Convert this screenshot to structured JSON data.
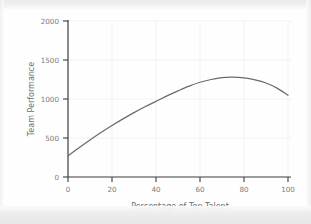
{
  "chart_data": {
    "type": "line",
    "title": "",
    "xlabel": "Percentage of Top Talent",
    "ylabel": "Team Performance",
    "xlim": [
      0,
      100
    ],
    "ylim": [
      0,
      2000
    ],
    "xticks": [
      0,
      20,
      40,
      60,
      80,
      100
    ],
    "yticks": [
      0,
      500,
      1000,
      1500,
      2000
    ],
    "xtick_labels": [
      "0",
      "20",
      "40",
      "60",
      "80",
      "100"
    ],
    "ytick_labels": [
      "0",
      "500",
      "1000",
      "1500",
      "2000"
    ],
    "grid": true,
    "legend": "none",
    "series": [
      {
        "name": "Team Performance",
        "color": "#6b6b6b",
        "x": [
          0,
          5,
          10,
          15,
          20,
          25,
          30,
          35,
          40,
          45,
          50,
          55,
          60,
          65,
          70,
          75,
          80,
          85,
          90,
          95,
          100
        ],
        "y": [
          270,
          375,
          475,
          570,
          660,
          745,
          825,
          900,
          970,
          1040,
          1105,
          1165,
          1215,
          1250,
          1275,
          1280,
          1270,
          1245,
          1205,
          1140,
          1050
        ]
      }
    ],
    "annotations": {
      "peak_x": 72,
      "peak_y": 1280,
      "start_y": 270,
      "end_y": 1050,
      "shape": "inverted-u"
    }
  },
  "axis_labels": {
    "x_title": "Percentage of Top Talent",
    "y_title": "Team Performance",
    "x_ticks": [
      "0",
      "20",
      "40",
      "60",
      "80",
      "100"
    ],
    "y_ticks": [
      "0",
      "500",
      "1000",
      "1500",
      "2000"
    ]
  },
  "colors": {
    "curve": "#6b6b6b",
    "axis": "#3c3c3c",
    "grid": "#f0f0f0",
    "tick_text": "#7b7b7b",
    "title_text": "#6e6e6e",
    "page_background": "#fefefe"
  }
}
